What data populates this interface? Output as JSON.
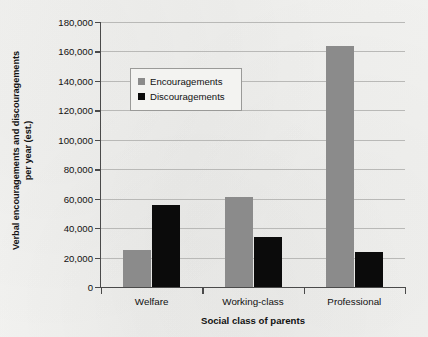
{
  "chart_data": {
    "type": "bar",
    "title": "",
    "xlabel": "Social class of parents",
    "ylabel": "Verbal encouragements and discouragements per year (est.)",
    "ylabel_line1": "Verbal encouragements and discouragements",
    "ylabel_line2": "per year (est.)",
    "categories": [
      "Welfare",
      "Working-class",
      "Professional"
    ],
    "series": [
      {
        "name": "Encouragements",
        "color": "#8b8b8b",
        "values": [
          25000,
          61000,
          164000
        ]
      },
      {
        "name": "Discouragements",
        "color": "#0b0b0b",
        "values": [
          56000,
          34000,
          24000
        ]
      }
    ],
    "ylim": [
      0,
      180000
    ],
    "ytick_step": 20000,
    "ytick_labels": [
      "0",
      "20,000",
      "40,000",
      "60,000",
      "80,000",
      "100,000",
      "120,000",
      "140,000",
      "160,000",
      "180,000"
    ],
    "ytick_values": [
      0,
      20000,
      40000,
      60000,
      80000,
      100000,
      120000,
      140000,
      160000,
      180000
    ],
    "grid": true,
    "legend_position": "upper-left-inside",
    "background_color": "#f1f1ef",
    "gridline_color": "#b9b9b7",
    "axis_color": "#4a4a4a"
  }
}
